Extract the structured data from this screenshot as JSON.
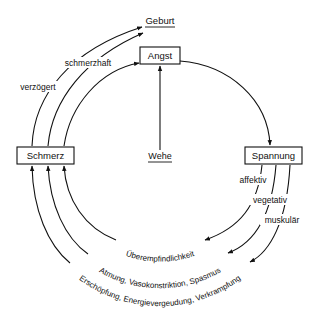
{
  "diagram": {
    "type": "cycle-diagram",
    "nodes": {
      "geburt": {
        "label": "Geburt",
        "underlined": true
      },
      "angst": {
        "label": "Angst",
        "boxed": true
      },
      "spannung": {
        "label": "Spannung",
        "boxed": true
      },
      "schmerz": {
        "label": "Schmerz",
        "boxed": true
      },
      "wehe": {
        "label": "Wehe",
        "underlined": true
      }
    },
    "edge_labels": {
      "verzoegert": "verzögert",
      "schmerzhaft": "schmerzhaft",
      "affektiv": "affektiv",
      "vegetativ": "vegetativ",
      "muskulaer": "muskulär",
      "inner_arc": "Überempfindlichkeit",
      "middle_arc": "Atmung, Vasokonstriktion, Spasmus",
      "outer_arc": "Erschöpfung, Energievergeudung, Verkrampfung"
    },
    "edges": [
      {
        "from": "Schmerz",
        "to": "Geburt",
        "label": "verzögert"
      },
      {
        "from": "Schmerz",
        "to": "Geburt",
        "label": "schmerzhaft"
      },
      {
        "from": "Schmerz",
        "to": "Angst",
        "label": ""
      },
      {
        "from": "Wehe",
        "to": "Angst",
        "label": ""
      },
      {
        "from": "Angst",
        "to": "Spannung",
        "label": ""
      },
      {
        "from": "Spannung",
        "to": "Schmerz",
        "label": "affektiv / Überempfindlichkeit"
      },
      {
        "from": "Spannung",
        "to": "Schmerz",
        "label": "vegetativ / Atmung, Vasokonstriktion, Spasmus"
      },
      {
        "from": "Spannung",
        "to": "Schmerz",
        "label": "muskulär / Erschöpfung, Energievergeudung, Verkrampfung"
      }
    ],
    "colors": {
      "ink": "#111111",
      "background": "#ffffff"
    }
  }
}
